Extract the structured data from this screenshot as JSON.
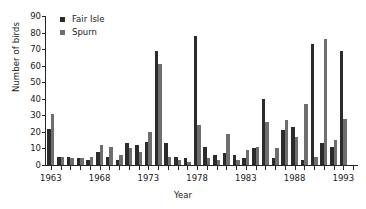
{
  "chart_data": {
    "type": "bar",
    "title": "",
    "xlabel": "Year",
    "ylabel": "Number of birds",
    "ylim": [
      0,
      90
    ],
    "ytick_step": 10,
    "yticks": [
      0,
      10,
      20,
      30,
      40,
      50,
      60,
      70,
      80,
      90
    ],
    "grid": false,
    "legend_position": "top-left",
    "xtick_labels": [
      "1963",
      "1968",
      "1973",
      "1978",
      "1983",
      "1988",
      "1993"
    ],
    "categories": [
      "1963",
      "1964",
      "1965",
      "1966",
      "1967",
      "1968",
      "1969",
      "1970",
      "1971",
      "1972",
      "1973",
      "1974",
      "1975",
      "1976",
      "1977",
      "1978",
      "1979",
      "1980",
      "1981",
      "1982",
      "1983",
      "1984",
      "1985",
      "1986",
      "1987",
      "1988",
      "1989",
      "1990",
      "1991",
      "1992",
      "1993",
      "1994"
    ],
    "series": [
      {
        "name": "Fair Isle",
        "color": "#2b2b2b",
        "values": [
          22,
          5,
          5,
          4,
          3,
          8,
          5,
          3,
          13,
          12,
          14,
          69,
          13,
          5,
          4,
          78,
          11,
          6,
          7,
          6,
          4,
          10,
          40,
          4,
          21,
          23,
          3,
          73,
          13,
          11,
          69,
          0
        ]
      },
      {
        "name": "Spurn",
        "color": "#6e6e6e",
        "values": [
          31,
          5,
          4,
          4,
          5,
          12,
          11,
          6,
          10,
          8,
          20,
          61,
          5,
          3,
          2,
          24,
          4,
          3,
          19,
          3,
          9,
          11,
          26,
          10,
          27,
          17,
          37,
          5,
          76,
          15,
          28,
          0
        ]
      }
    ]
  },
  "legend": {
    "entries": [
      {
        "label": "Fair Isle"
      },
      {
        "label": "Spurn"
      }
    ]
  }
}
